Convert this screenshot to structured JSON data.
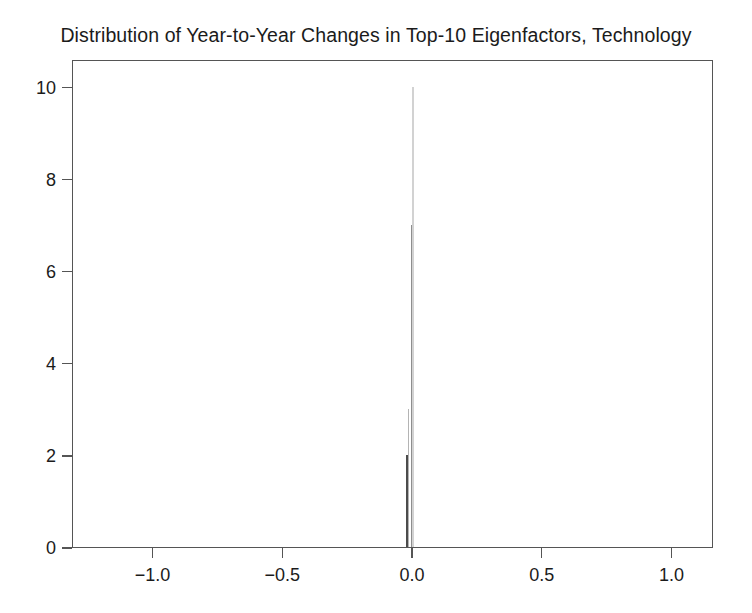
{
  "chart_data": {
    "type": "bar",
    "title": "Distribution of Year-to-Year Changes in Top-10 Eigenfactors, Technology",
    "subtitle": "",
    "xlabel": "",
    "ylabel": "",
    "xlim": [
      -1.31,
      1.16
    ],
    "ylim": [
      0,
      10.6
    ],
    "grid": false,
    "legend": null,
    "x_ticks": [
      -1.0,
      -0.5,
      0.0,
      0.5,
      1.0
    ],
    "x_tick_labels": [
      "-1.0",
      "-0.5",
      "0.0",
      "0.5",
      "1.0"
    ],
    "y_ticks": [
      0,
      2,
      4,
      6,
      8,
      10
    ],
    "y_tick_labels": [
      "0",
      "2",
      "4",
      "6",
      "8",
      "10"
    ],
    "note": "Histogram of year-to-year changes; all mass concentrated in narrow bins at approximately zero.",
    "bins": [
      {
        "label": "bin-minus-0.022",
        "x_center": -0.0225,
        "width": 0.009,
        "value": 2,
        "color": "#4c4c4c"
      },
      {
        "label": "bin-minus-0.018",
        "x_center": -0.0175,
        "width": 0.007,
        "value": 3,
        "color": "#b4b4b4"
      },
      {
        "label": "bin-minus-0.006",
        "x_center": -0.0055,
        "width": 0.008,
        "value": 7,
        "color": "#8e8e8e"
      },
      {
        "label": "bin-0.000",
        "x_center": 0.0005,
        "width": 0.008,
        "value": 10,
        "color": "#d2d2d2"
      }
    ],
    "categories": [
      "-0.0225",
      "-0.0175",
      "-0.0055",
      "0.0005"
    ],
    "values": [
      2,
      3,
      7,
      10
    ]
  },
  "axes": {
    "frame_color": "#555555",
    "background": "#ffffff"
  }
}
